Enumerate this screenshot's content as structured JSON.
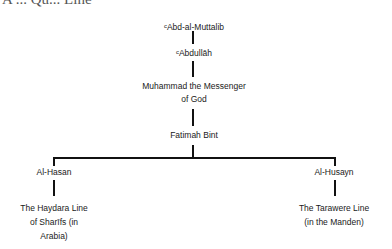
{
  "heading_fragment": "A ... Qu... Line",
  "nodes": {
    "abd_al_muttalib": {
      "prefix": "c",
      "label": "Abd-al-Muttalib"
    },
    "abdullah": {
      "prefix": "c",
      "label": "Abdullāh"
    },
    "muhammad": {
      "line1": "Muhammad the Messenger",
      "line2": "of God"
    },
    "fatimah": {
      "label": "Fatimah Bint"
    },
    "al_hasan": {
      "label": "Al-Hasan"
    },
    "al_husayn": {
      "label": "Al-Husayn"
    },
    "haydara": {
      "line1": "The Haydara Line",
      "line2": "of Sharīfs (in",
      "line3": "Arabia)"
    },
    "tarawere": {
      "line1": "The Tarawere Line",
      "line2": "(in the Manden)"
    }
  },
  "colors": {
    "line": "#111111",
    "text": "#1a1a1a"
  }
}
